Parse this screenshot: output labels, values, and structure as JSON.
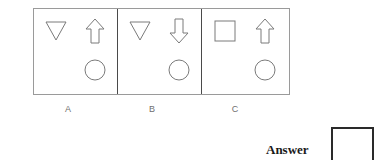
{
  "figure": {
    "type": "abstract-reasoning-puzzle",
    "stroke_color": "#7a7a7a",
    "frame_color": "#9a9a9a",
    "divider_color": "#4a4a4a",
    "panels": [
      {
        "caption": "A",
        "shapes": [
          {
            "position": "top-left",
            "icon": "triangle-down-icon"
          },
          {
            "position": "top-right",
            "icon": "arrow-up-icon"
          },
          {
            "position": "bottom-right",
            "icon": "circle-icon"
          }
        ]
      },
      {
        "caption": "B",
        "shapes": [
          {
            "position": "top-left",
            "icon": "triangle-down-icon"
          },
          {
            "position": "top-right",
            "icon": "arrow-down-icon"
          },
          {
            "position": "bottom-right",
            "icon": "circle-icon"
          }
        ]
      },
      {
        "caption": "C",
        "shapes": [
          {
            "position": "top-left",
            "icon": "square-icon"
          },
          {
            "position": "top-right",
            "icon": "arrow-up-icon"
          },
          {
            "position": "bottom-right",
            "icon": "circle-icon"
          }
        ]
      }
    ]
  },
  "answer": {
    "label": "Answer",
    "value": ""
  }
}
